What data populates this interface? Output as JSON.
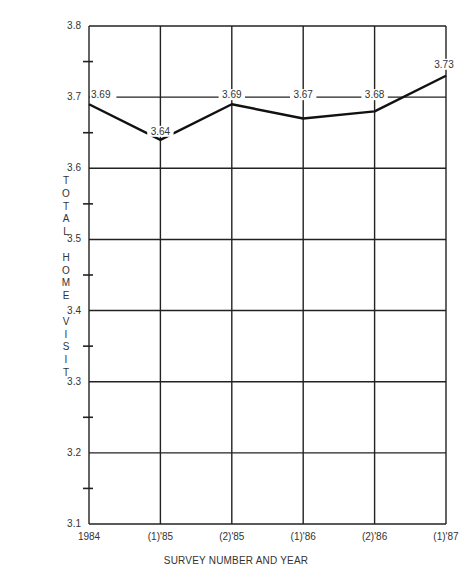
{
  "chart_data": {
    "type": "line",
    "title": "",
    "xlabel": "SURVEY NUMBER AND YEAR",
    "ylabel": "TOTAL HOME VISIT",
    "categories": [
      "1984",
      "(1)'85",
      "(2)'85",
      "(1)'86",
      "(2)'86",
      "(1)'87"
    ],
    "series": [
      {
        "name": "Total Home Visit",
        "values": [
          3.69,
          3.64,
          3.69,
          3.67,
          3.68,
          3.73
        ]
      }
    ],
    "data_labels": [
      "3.69",
      "3.64",
      "3.69",
      "3.67",
      "3.68",
      "3.73"
    ],
    "ylim": [
      3.1,
      3.8
    ],
    "yticks": [
      "3.8",
      "3.7",
      "3.6",
      "3.5",
      "3.4",
      "3.3",
      "3.2",
      "3.1"
    ],
    "grid": true,
    "legend": "none"
  },
  "labels": {
    "ylabel_letters": [
      "T",
      "O",
      "T",
      "A",
      "L",
      "",
      "H",
      "O",
      "M",
      "E",
      "",
      "V",
      "I",
      "S",
      "I",
      "T"
    ],
    "xtitle": "SURVEY NUMBER AND YEAR"
  }
}
